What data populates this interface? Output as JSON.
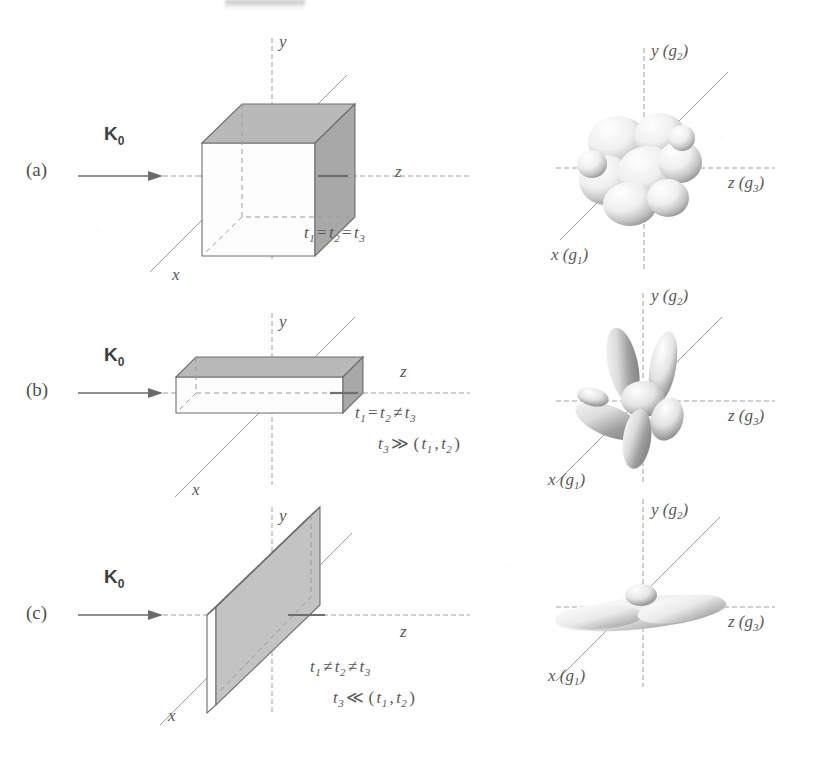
{
  "figure": {
    "rows": [
      {
        "tag": "(a)",
        "beam_label": "K",
        "beam_sub": "0",
        "real_axes": {
          "y": "y",
          "z": "z",
          "x": "x"
        },
        "recip_axes": {
          "y": "y (g",
          "y_sub": "2",
          "z": "z (g",
          "z_sub": "3",
          "x": "x (g",
          "x_sub": "1"
        },
        "shape": "cube",
        "equations": [
          {
            "parts": [
              {
                "t": "t",
                "sub": "1"
              },
              {
                "op": "="
              },
              {
                "t": "t",
                "sub": "2"
              },
              {
                "op": "="
              },
              {
                "t": "t",
                "sub": "3"
              }
            ]
          }
        ]
      },
      {
        "tag": "(b)",
        "beam_label": "K",
        "beam_sub": "0",
        "real_axes": {
          "y": "y",
          "z": "z",
          "x": "x"
        },
        "recip_axes": {
          "y": "y (g",
          "y_sub": "2",
          "z": "z (g",
          "z_sub": "3",
          "x": "x (g",
          "x_sub": "1"
        },
        "shape": "slab",
        "equations": [
          {
            "parts": [
              {
                "t": "t",
                "sub": "1"
              },
              {
                "op": "="
              },
              {
                "t": "t",
                "sub": "2"
              },
              {
                "op": "≠"
              },
              {
                "t": "t",
                "sub": "3"
              }
            ]
          },
          {
            "parts": [
              {
                "t": "t",
                "sub": "3"
              },
              {
                "op": "≫"
              },
              {
                "op": "("
              },
              {
                "t": "t",
                "sub": "1"
              },
              {
                "op": ","
              },
              {
                "t": "t",
                "sub": "2"
              },
              {
                "op": ")"
              }
            ]
          }
        ]
      },
      {
        "tag": "(c)",
        "beam_label": "K",
        "beam_sub": "0",
        "real_axes": {
          "y": "y",
          "z": "z",
          "x": "x"
        },
        "recip_axes": {
          "y": "y (g",
          "y_sub": "2",
          "z": "z (g",
          "z_sub": "3",
          "x": "x (g",
          "x_sub": "1"
        },
        "shape": "plate",
        "equations": [
          {
            "parts": [
              {
                "t": "t",
                "sub": "1"
              },
              {
                "op": "≠"
              },
              {
                "t": "t",
                "sub": "2"
              },
              {
                "op": "≠"
              },
              {
                "t": "t",
                "sub": "3"
              }
            ]
          },
          {
            "parts": [
              {
                "t": "t",
                "sub": "3"
              },
              {
                "op": "≪"
              },
              {
                "op": "("
              },
              {
                "t": "t",
                "sub": "1"
              },
              {
                "op": ","
              },
              {
                "t": "t",
                "sub": "2"
              },
              {
                "op": ")"
              }
            ]
          }
        ]
      }
    ],
    "axis_close_paren": ")",
    "colors": {
      "ink": "#555555",
      "line": "#9a9a9a",
      "edge": "#6e6e6e",
      "face_gray": "#b9b9b9",
      "face_white": "#fdfdfd",
      "background": "#ffffff"
    }
  }
}
